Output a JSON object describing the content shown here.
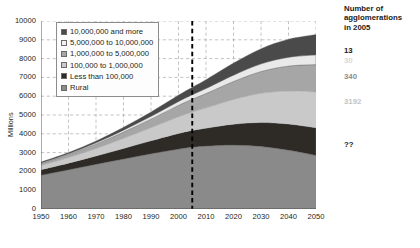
{
  "chart_data": {
    "type": "area",
    "title": "",
    "xlabel": "",
    "ylabel": "Millions",
    "xlim": [
      1950,
      2050
    ],
    "ylim": [
      0,
      10000
    ],
    "grid": true,
    "legend_position": "top-left",
    "x": [
      1950,
      1960,
      1970,
      1980,
      1990,
      2000,
      2005,
      2010,
      2020,
      2030,
      2040,
      2050
    ],
    "xticks": [
      "1950",
      "1960",
      "1970",
      "1980",
      "1990",
      "2000",
      "2010",
      "2020",
      "2030",
      "2040",
      "2050"
    ],
    "yticks": [
      "0",
      "1000",
      "2000",
      "3000",
      "4000",
      "5000",
      "6000",
      "7000",
      "8000",
      "9000",
      "10000"
    ],
    "annotation_line": {
      "x": 2005,
      "style": "bold-dashed",
      "color": "#000000"
    },
    "series": [
      {
        "name": "Rural",
        "color": "#8a8a8a",
        "values": [
          1790,
          2080,
          2370,
          2650,
          2930,
          3180,
          3280,
          3340,
          3390,
          3320,
          3120,
          2840
        ]
      },
      {
        "name": "Less than 100,000",
        "color": "#2e2a26",
        "values": [
          300,
          360,
          450,
          570,
          700,
          840,
          900,
          960,
          1120,
          1280,
          1400,
          1480
        ]
      },
      {
        "name": "100,000 to 1,000,000",
        "color": "#c9c9c9",
        "values": [
          230,
          300,
          400,
          540,
          700,
          890,
          980,
          1080,
          1320,
          1560,
          1760,
          1910
        ]
      },
      {
        "name": "1,000,000 to 5,000,000",
        "color": "#a6a6a6",
        "values": [
          110,
          160,
          230,
          330,
          450,
          600,
          680,
          760,
          950,
          1150,
          1320,
          1450
        ]
      },
      {
        "name": "5,000,000 to 10,000,000",
        "color": "#e9e9e9",
        "values": [
          30,
          45,
          70,
          105,
          150,
          210,
          240,
          270,
          340,
          410,
          470,
          520
        ]
      },
      {
        "name": "10,000,000 and more",
        "color": "#4a4a4a",
        "values": [
          40,
          60,
          95,
          150,
          230,
          340,
          400,
          470,
          640,
          810,
          960,
          1080
        ]
      }
    ],
    "totals": [
      2500,
      3005,
      3615,
      4345,
      5160,
      6060,
      6480,
      6880,
      7760,
      8530,
      9030,
      9280
    ]
  },
  "legend": {
    "items": [
      {
        "label": "10,000,000 and more",
        "color": "#4a4a4a"
      },
      {
        "label": "5,000,000 to 10,000,000",
        "color": "#f2f2f2"
      },
      {
        "label": "1,000,000 to 5,000,000",
        "color": "#a6a6a6"
      },
      {
        "label": "100,000 to 1,000,000",
        "color": "#c9c9c9"
      },
      {
        "label": "Less than 100,000",
        "color": "#2e2a26"
      },
      {
        "label": "Rural",
        "color": "#8a8a8a"
      }
    ]
  },
  "axes": {
    "y_label": "Millions",
    "y_ticks": [
      "10000",
      "9000",
      "8000",
      "7000",
      "6000",
      "5000",
      "4000",
      "3000",
      "2000",
      "1000",
      "0"
    ],
    "x_ticks": [
      "1950",
      "1960",
      "1970",
      "1980",
      "1990",
      "2000",
      "2010",
      "2020",
      "2030",
      "2040",
      "2050"
    ]
  },
  "side_panel": {
    "heading_line1": "Number of",
    "heading_line2": "agglomerations",
    "heading_line3": "in 2005",
    "entries": [
      {
        "value": "13",
        "color": "#1a1a1a"
      },
      {
        "value": "30",
        "color": "#d8d8d8"
      },
      {
        "value": "340",
        "color": "#8c8c8c"
      },
      {
        "value": "3192",
        "color": "#c4c4c4"
      },
      {
        "value": "??",
        "color": "#1a1a1a"
      }
    ]
  }
}
